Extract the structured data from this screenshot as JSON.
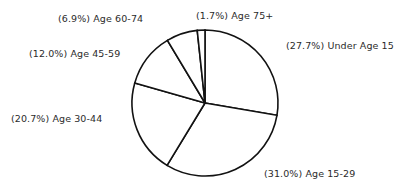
{
  "chart_data": {
    "type": "pie",
    "title": "",
    "xlabel": "",
    "ylabel": "",
    "legend_position": "none",
    "grid": false,
    "start_angle_deg": 0,
    "direction": "clockwise",
    "categories": [
      "Under Age 15",
      "Age 15-29",
      "Age 30-44",
      "Age 45-59",
      "Age 60-74",
      "Age 75+"
    ],
    "values": [
      27.7,
      31.0,
      20.7,
      12.0,
      6.9,
      1.7
    ],
    "value_unit": "percent",
    "slice_fill_color": "#ffffff",
    "slice_stroke_color": "#121212",
    "label_color": "#2b2b2b",
    "background_color": "#ffffff",
    "labels": {
      "under_15": "(27.7%) Under Age 15",
      "age_15_29": "(31.0%) Age 15-29",
      "age_30_44": "(20.7%) Age 30-44",
      "age_45_59": "(12.0%) Age 45-59",
      "age_60_74": "(6.9%) Age 60-74",
      "age_75_plus": "(1.7%) Age 75+"
    }
  },
  "geometry": {
    "center_x": 205,
    "center_y": 103,
    "radius": 73
  }
}
